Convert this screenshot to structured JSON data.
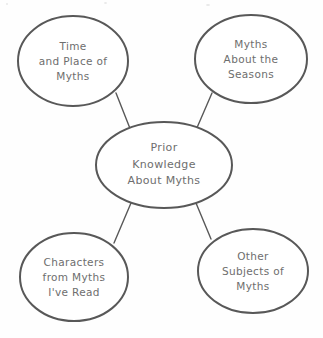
{
  "document": {
    "type": "graphic-organizer",
    "style": "concept web / cluster map",
    "background_color": "#fefefe",
    "stroke_color": "#585858",
    "text_color": "#6e6e6e"
  },
  "center": {
    "id": "prior-knowledge-about-myths",
    "lines": [
      "Prior",
      "Knowledge",
      "About Myths"
    ],
    "text": "Prior Knowledge About Myths",
    "cx": 164,
    "cy": 165,
    "rx": 68,
    "ry": 43
  },
  "nodes": [
    {
      "id": "time-and-place-of-myths",
      "position": "top-left",
      "lines": [
        "Time",
        "and Place of",
        "Myths"
      ],
      "text": "Time and Place of Myths",
      "cx": 73,
      "cy": 61,
      "rx": 55,
      "ry": 45
    },
    {
      "id": "myths-about-the-seasons",
      "position": "top-right",
      "lines": [
        "Myths",
        "About the",
        "Seasons"
      ],
      "text": "Myths About the Seasons",
      "cx": 251,
      "cy": 59,
      "rx": 56,
      "ry": 44
    },
    {
      "id": "characters-from-myths-ive-read",
      "position": "bottom-left",
      "lines": [
        "Characters",
        "from Myths",
        "I've Read"
      ],
      "text": "Characters from Myths I've Read",
      "cx": 74,
      "cy": 277,
      "rx": 54,
      "ry": 44
    },
    {
      "id": "other-subjects-of-myths",
      "position": "bottom-right",
      "lines": [
        "Other",
        "Subjects of",
        "Myths"
      ],
      "text": "Other Subjects of Myths",
      "cx": 253,
      "cy": 271,
      "rx": 55,
      "ry": 42
    }
  ],
  "connectors": [
    {
      "id": "connector-top-left",
      "from": "time-and-place-of-myths",
      "to": "prior-knowledge-about-myths",
      "x1": 116,
      "y1": 93,
      "x2": 131,
      "y2": 131
    },
    {
      "id": "connector-top-right",
      "from": "myths-about-the-seasons",
      "to": "prior-knowledge-about-myths",
      "x1": 212,
      "y1": 93,
      "x2": 196,
      "y2": 130
    },
    {
      "id": "connector-bottom-left",
      "from": "characters-from-myths-ive-read",
      "to": "prior-knowledge-about-myths",
      "x1": 114,
      "y1": 243,
      "x2": 131,
      "y2": 203
    },
    {
      "id": "connector-bottom-right",
      "from": "other-subjects-of-myths",
      "to": "prior-knowledge-about-myths",
      "x1": 211,
      "y1": 239,
      "x2": 196,
      "y2": 203
    }
  ]
}
